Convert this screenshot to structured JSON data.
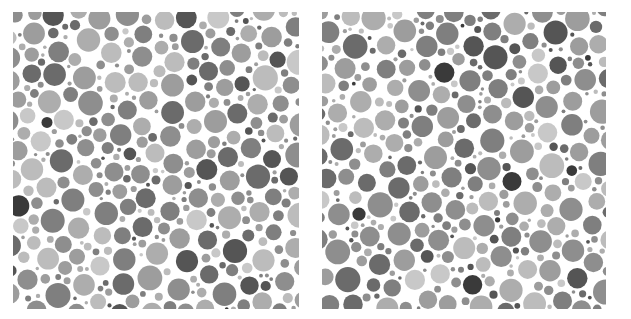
{
  "canvas": {
    "width": 631,
    "height": 319,
    "background": "#ffffff"
  },
  "plates": [
    {
      "name": "left-dot-plate",
      "x": 13,
      "y": 12,
      "width": 286,
      "height": 297,
      "seed": 17
    },
    {
      "name": "right-dot-plate",
      "x": 322,
      "y": 12,
      "width": 284,
      "height": 297,
      "seed": 91
    }
  ],
  "dots": {
    "palette": [
      "#3a3a3a",
      "#555555",
      "#6b6b6b",
      "#7f7f7f",
      "#8e8e8e",
      "#9d9d9d",
      "#adadad",
      "#bcbcbc",
      "#c8c8c8"
    ],
    "weights": [
      1,
      3,
      5,
      7,
      8,
      8,
      7,
      5,
      3
    ],
    "radii": [
      2,
      3,
      4,
      5,
      6,
      7,
      8,
      9,
      10,
      11
    ],
    "gap": 1.2,
    "attempts": 9000
  }
}
